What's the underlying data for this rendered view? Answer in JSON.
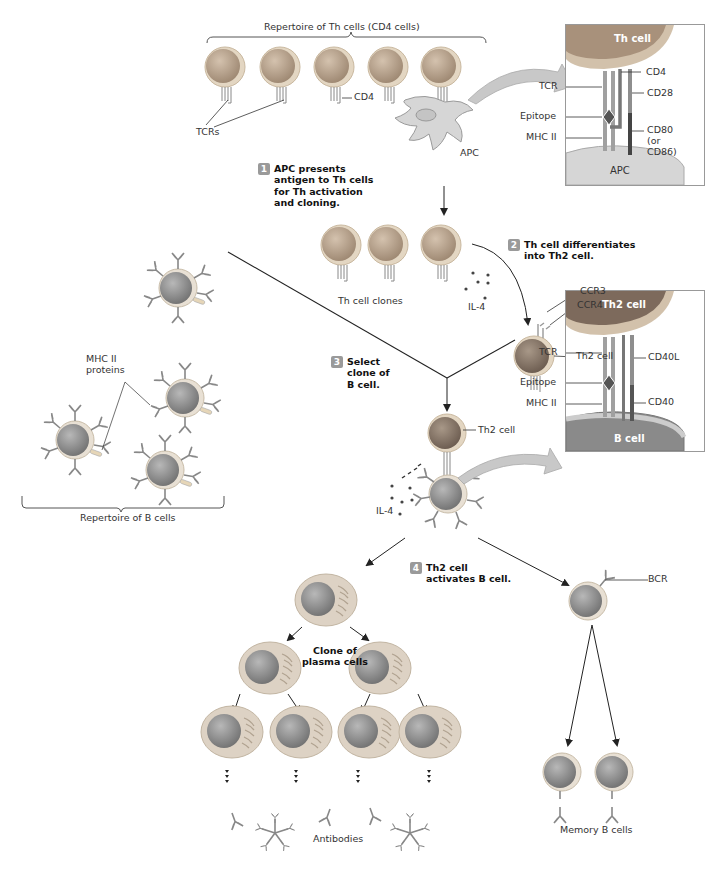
{
  "figure": {
    "colors": {
      "cell_membrane": "#e3d6c2",
      "th_nucleus": "#b09a84",
      "b_nucleus": "#8a8a8a",
      "plasma_cytoplasm": "#ddd2c4",
      "receptor_gray": "#a0a0a0",
      "costim_dark": "#555555",
      "step_badge": "#9a9a9a",
      "inset_border": "#999999",
      "arrow": "#222222"
    }
  },
  "top_section": {
    "repertoire_th_label": "Repertoire of Th cells (CD4 cells)",
    "tcrs_label": "TCRs",
    "cd4_label": "CD4",
    "apc_label": "APC"
  },
  "inset_th_apc": {
    "cell_label": "Th cell",
    "base_label": "APC",
    "left_labels": [
      "TCR",
      "Epitope",
      "MHC II"
    ],
    "right_labels": [
      "CD4",
      "CD28",
      "CD80\n(or\nCD86)"
    ]
  },
  "steps": [
    {
      "number": "1",
      "text": "APC presents\nantigen to Th cells\nfor Th activation\nand cloning."
    },
    {
      "number": "2",
      "text": "Th cell differentiates\ninto Th2 cell."
    },
    {
      "number": "3",
      "text": "Select\nclone of\nB cell."
    },
    {
      "number": "4",
      "text": "Th2 cell\nactivates B cell."
    }
  ],
  "middle_section": {
    "th_clones_label": "Th cell clones",
    "il4_label": "IL-4",
    "ccr3_label": "CCR3",
    "ccr4_label": "CCR4",
    "th2_cell_label": "Th2 cell",
    "mhc_proteins_label": "MHC II\nproteins",
    "repertoire_b_label": "Repertoire of B cells"
  },
  "inset_th2_b": {
    "cell_label": "Th2 cell",
    "base_label": "B cell",
    "left_labels": [
      "TCR",
      "Epitope",
      "MHC II"
    ],
    "right_labels": [
      "CD40L",
      "CD40"
    ]
  },
  "lower_section": {
    "th2_cell_label": "Th2 cell",
    "il4_label": "IL-4",
    "plasma_clone_label": "Clone of\nplasma cells",
    "antibodies_label": "Antibodies",
    "bcr_label": "BCR",
    "memory_label": "Memory B cells"
  }
}
